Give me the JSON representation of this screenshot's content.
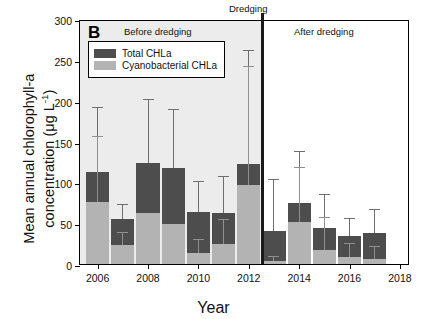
{
  "chart_data": {
    "type": "bar",
    "title": "",
    "panel_label": "B",
    "xlabel": "Year",
    "ylabel_line1": "Mean annual chlorophyll-a",
    "ylabel_line2": "concentration (μg L",
    "ylabel_sup": "-1",
    "ylabel_close": ")",
    "ylim": [
      0,
      300
    ],
    "yticks": [
      0,
      50,
      100,
      150,
      200,
      250,
      300
    ],
    "xlim": [
      2005.3,
      2018.4
    ],
    "xticks": [
      2006,
      2008,
      2010,
      2012,
      2014,
      2016,
      2018
    ],
    "grid": false,
    "legend_position": "top-left-inside",
    "categories": [
      2006,
      2007,
      2008,
      2009,
      2010,
      2011,
      2012,
      2013,
      2014,
      2015,
      2016,
      2017
    ],
    "series": [
      {
        "name": "Total CHLa",
        "color": "#4d4d4d",
        "values": [
          113,
          55,
          124,
          118,
          64,
          62,
          123,
          40,
          75,
          44,
          34,
          38
        ],
        "err_upper": [
          191,
          72,
          201,
          188,
          100,
          106,
          261,
          103,
          137,
          84,
          55,
          66
        ]
      },
      {
        "name": "Cyanobacterial CHLa",
        "color": "#b3b3b3",
        "values": [
          76,
          23,
          62,
          49,
          14,
          24,
          97,
          4,
          52,
          17,
          8,
          6
        ],
        "err_upper": [
          156,
          38,
          62,
          49,
          29,
          54,
          241,
          9,
          118,
          56,
          24,
          21
        ]
      }
    ],
    "annotations": [
      {
        "name": "before-dredging",
        "text": "Before dredging",
        "x": 2007.6,
        "y": 288
      },
      {
        "name": "dredging",
        "text": "Dredging",
        "x": 2012.5,
        "y": 305
      },
      {
        "name": "after-dredging",
        "text": "After dredging",
        "x": 2015.4,
        "y": 288
      }
    ],
    "dredging_line_x": 2012.55,
    "shaded_region": {
      "from": 2005.3,
      "to": 2012.55,
      "color": "#ececec"
    }
  },
  "legend": {
    "items": [
      {
        "label": "Total CHLa",
        "color": "#4d4d4d"
      },
      {
        "label": "Cyanobacterial CHLa",
        "color": "#b3b3b3"
      }
    ]
  }
}
